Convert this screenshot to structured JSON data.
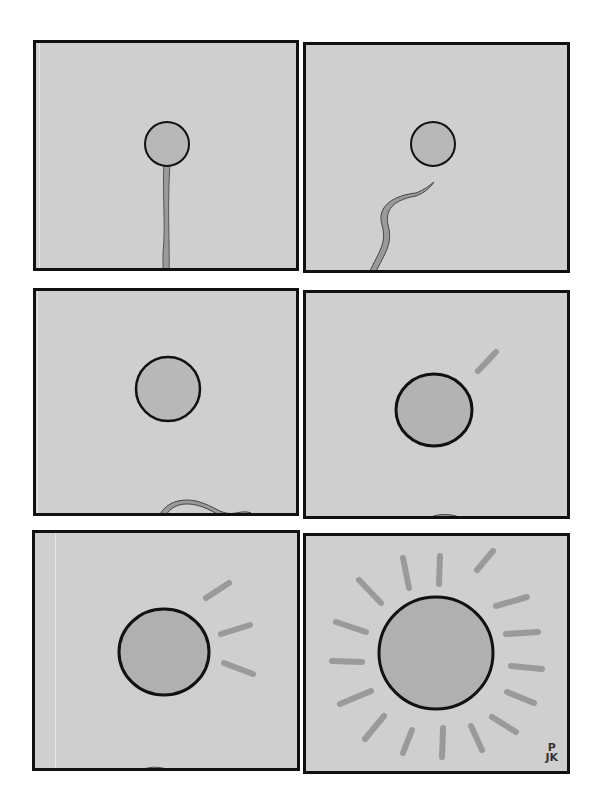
{
  "comic": {
    "title": "",
    "panel_count": 6,
    "colors": {
      "background": "#cfcfcf",
      "border": "#111111",
      "sun_fill": "#b5b5b5",
      "ray": "#9a9a9a",
      "stem": "#9a9a9a"
    },
    "panels": [
      {
        "id": 1,
        "description": "Small circle on a tall thin stem, like a lollipop or dandelion"
      },
      {
        "id": 2,
        "description": "Circle floats free; the stem below curls and drifts away"
      },
      {
        "id": 3,
        "description": "Circle grows larger; stem lies curled at the bottom edge"
      },
      {
        "id": 4,
        "description": "Circle larger still with one ray appearing; stem remnant at bottom"
      },
      {
        "id": 5,
        "description": "Circle with three rays on the right side"
      },
      {
        "id": 6,
        "description": "Full sun with rays all around"
      }
    ],
    "signature": {
      "line1": "P",
      "line2": "JK"
    }
  }
}
